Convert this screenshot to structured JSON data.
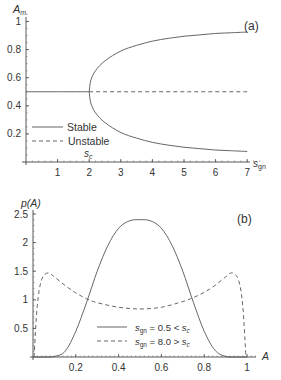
{
  "chart_data": [
    {
      "panel": "(a)",
      "type": "line",
      "title": "",
      "xlabel": "s_gn",
      "ylabel": "A_m",
      "xlim": [
        0,
        7.4
      ],
      "ylim": [
        0,
        1.05
      ],
      "xticks": [
        1,
        2,
        3,
        4,
        5,
        6,
        7
      ],
      "yticks": [
        0.2,
        0.4,
        0.6,
        0.8,
        1
      ],
      "annotations": [
        {
          "text": "s_c",
          "x": 2,
          "y": 0.02
        }
      ],
      "legend": {
        "position": "lower-left",
        "entries": [
          "Stable",
          "Unstable"
        ]
      },
      "series": [
        {
          "name": "Stable",
          "style": "solid",
          "x": [
            0,
            2
          ],
          "y": [
            0.5,
            0.5
          ]
        },
        {
          "name": "Unstable",
          "style": "dashed",
          "x": [
            2,
            7
          ],
          "y": [
            0.5,
            0.5
          ]
        },
        {
          "name": "Stable (upper branch)",
          "style": "solid",
          "x": [
            2,
            2.05,
            2.2,
            2.5,
            3,
            3.5,
            4,
            4.5,
            5,
            5.5,
            6,
            6.5,
            7
          ],
          "y": [
            0.5,
            0.58,
            0.65,
            0.72,
            0.79,
            0.83,
            0.86,
            0.88,
            0.895,
            0.905,
            0.915,
            0.92,
            0.925
          ]
        },
        {
          "name": "Stable (lower branch)",
          "style": "solid",
          "x": [
            2,
            2.05,
            2.2,
            2.5,
            3,
            3.5,
            4,
            4.5,
            5,
            5.5,
            6,
            6.5,
            7
          ],
          "y": [
            0.5,
            0.42,
            0.35,
            0.28,
            0.21,
            0.17,
            0.14,
            0.12,
            0.105,
            0.095,
            0.085,
            0.08,
            0.075
          ]
        }
      ]
    },
    {
      "panel": "(b)",
      "type": "line",
      "title": "",
      "xlabel": "A",
      "ylabel": "p(A)",
      "xlim": [
        0,
        1.05
      ],
      "ylim": [
        0,
        2.55
      ],
      "xticks": [
        0.2,
        0.4,
        0.6,
        0.8,
        1
      ],
      "yticks": [
        0.5,
        1,
        1.5,
        2,
        2.5
      ],
      "legend": {
        "position": "lower-right",
        "entries": [
          "s_gn = 0.5 < s_c",
          "s_gn = 8.0 > s_c"
        ]
      },
      "series": [
        {
          "name": "s_gn = 0.5 < s_c",
          "style": "solid",
          "x": [
            0,
            0.05,
            0.1,
            0.15,
            0.2,
            0.25,
            0.3,
            0.35,
            0.4,
            0.45,
            0.5,
            0.55,
            0.6,
            0.65,
            0.7,
            0.75,
            0.8,
            0.85,
            0.9,
            0.95,
            1
          ],
          "y": [
            0,
            0,
            0.01,
            0.1,
            0.45,
            0.95,
            1.5,
            1.95,
            2.25,
            2.38,
            2.4,
            2.38,
            2.25,
            1.95,
            1.5,
            0.95,
            0.45,
            0.12,
            0.01,
            0,
            0
          ]
        },
        {
          "name": "s_gn = 8.0 > s_c",
          "style": "dashed",
          "x": [
            0.005,
            0.02,
            0.04,
            0.07,
            0.1,
            0.15,
            0.2,
            0.25,
            0.3,
            0.4,
            0.5,
            0.6,
            0.7,
            0.75,
            0.8,
            0.85,
            0.9,
            0.93,
            0.96,
            0.98,
            0.995
          ],
          "y": [
            0,
            0.9,
            1.35,
            1.47,
            1.4,
            1.25,
            1.12,
            1.02,
            0.95,
            0.87,
            0.84,
            0.87,
            0.97,
            1.04,
            1.13,
            1.25,
            1.4,
            1.47,
            1.35,
            0.9,
            0
          ]
        }
      ]
    }
  ]
}
